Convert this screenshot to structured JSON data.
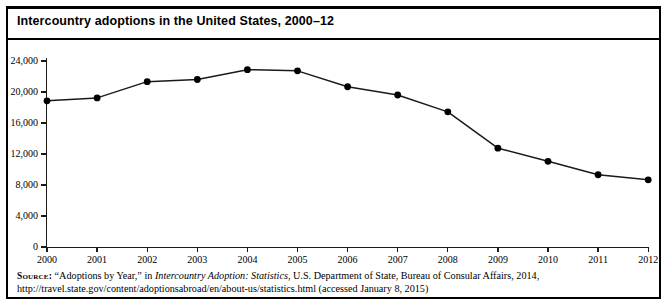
{
  "figure": {
    "title": "Intercountry adoptions in the United States, 2000–12",
    "border_color": "#000000",
    "background_color": "#ffffff"
  },
  "source_note": {
    "label": "Source:",
    "text_before_italic": " “Adoptions by Year,” in ",
    "italic_title": "Intercountry Adoption: Statistics",
    "text_after_italic": ", U.S. Department of State, Bureau of Consular Affairs, 2014, http://travel.state.gov/content/adoptionsabroad/en/about-us/statistics.html (accessed January 8, 2015)"
  },
  "chart_data": {
    "type": "line",
    "title": "Intercountry adoptions in the United States, 2000–12",
    "xlabel": "",
    "ylabel": "",
    "categories": [
      "2000",
      "2001",
      "2002",
      "2003",
      "2004",
      "2005",
      "2006",
      "2007",
      "2008",
      "2009",
      "2010",
      "2011",
      "2012"
    ],
    "x": [
      2000,
      2001,
      2002,
      2003,
      2004,
      2005,
      2006,
      2007,
      2008,
      2009,
      2010,
      2011,
      2012
    ],
    "values": [
      18856,
      19237,
      21335,
      21616,
      22884,
      22728,
      20679,
      19613,
      17438,
      12753,
      11059,
      9320,
      8668
    ],
    "series": [
      {
        "name": "Intercountry adoptions",
        "values": [
          18856,
          19237,
          21335,
          21616,
          22884,
          22728,
          20679,
          19613,
          17438,
          12753,
          11059,
          9320,
          8668
        ],
        "line_color": "#1a1a1a",
        "marker": "circle",
        "marker_color": "#000000"
      }
    ],
    "ylim": [
      0,
      24000
    ],
    "xlim": [
      2000,
      2012
    ],
    "ytick_values": [
      0,
      4000,
      8000,
      12000,
      16000,
      20000,
      24000
    ],
    "ytick_labels": [
      "0",
      "4,000",
      "8,000",
      "12,000",
      "16,000",
      "20,000",
      "24,000"
    ],
    "xtick_labels": [
      "2000",
      "2001",
      "2002",
      "2003",
      "2004",
      "2005",
      "2006",
      "2007",
      "2008",
      "2009",
      "2010",
      "2011",
      "2012"
    ],
    "grid": false,
    "legend": false,
    "legend_position": "none"
  }
}
